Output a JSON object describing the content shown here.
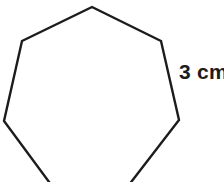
{
  "figure": {
    "kind": "regular-heptagon",
    "background_color": "#ffffff",
    "stroke_color": "#1c1c1c",
    "fill_color": "#ffffff",
    "stroke_width": 2.4,
    "cropped_at_bottom": true,
    "canvas": {
      "width": 224,
      "height": 182
    },
    "sides": 7,
    "vertices": [
      {
        "name": "top",
        "x": 92,
        "y": 7
      },
      {
        "name": "upper-right",
        "x": 161,
        "y": 41
      },
      {
        "name": "right",
        "x": 179,
        "y": 120
      },
      {
        "name": "lower-right",
        "x": 125,
        "y": 190
      },
      {
        "name": "lower-left",
        "x": 55,
        "y": 190
      },
      {
        "name": "left",
        "x": 4,
        "y": 121
      },
      {
        "name": "upper-left",
        "x": 22,
        "y": 41
      }
    ],
    "path": "M 92 7 L 161 41 L 179 120 L 125 190 L 55 190 L 4 121 L 22 41 Z"
  },
  "labels": {
    "side_length": {
      "text": "3 cm",
      "value": 3,
      "unit": "cm",
      "attached_to_edge": "upper-right-to-right",
      "color": "#1c1c1c",
      "x": 179,
      "y": 61
    }
  },
  "chart_data": {
    "type": "diagram",
    "shape": "heptagon",
    "side_count": 7,
    "side_length": 3,
    "side_length_unit": "cm",
    "annotations": [
      {
        "text": "3 cm",
        "target": "right-hand side of heptagon"
      }
    ]
  }
}
